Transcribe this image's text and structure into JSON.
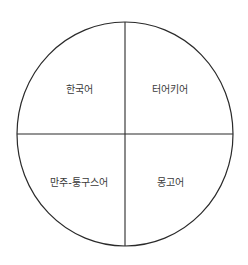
{
  "diagram": {
    "type": "quadrant-circle",
    "colors": {
      "line": "#2a2a2a",
      "text": "#3a3a3a",
      "background": "#ffffff"
    },
    "quadrants": [
      {
        "position": "top-left",
        "label": "한국어"
      },
      {
        "position": "top-right",
        "label": "터어키어"
      },
      {
        "position": "bottom-left",
        "label": "만주-퉁구스어"
      },
      {
        "position": "bottom-right",
        "label": "몽고어"
      }
    ]
  }
}
